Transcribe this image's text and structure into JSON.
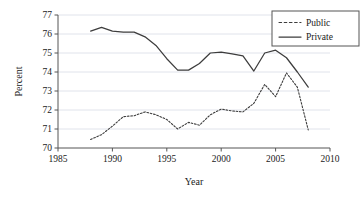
{
  "chart_data": {
    "type": "line",
    "title": "",
    "xlabel": "Year",
    "ylabel": "Percent",
    "xlim": [
      1985,
      2010
    ],
    "ylim": [
      70,
      77
    ],
    "xticks": [
      1985,
      1990,
      1995,
      2000,
      2005,
      2010
    ],
    "xticklabels": [
      "1985",
      "1990",
      "1995",
      "2000",
      "2005",
      "2010"
    ],
    "yticks": [
      70,
      71,
      72,
      73,
      74,
      75,
      76,
      77
    ],
    "yticklabels": [
      "70",
      "71",
      "72",
      "73",
      "74",
      "75",
      "76",
      "77"
    ],
    "grid": "horizontal",
    "legend_position": "top-right",
    "x": [
      1988,
      1989,
      1990,
      1991,
      1992,
      1993,
      1994,
      1995,
      1996,
      1997,
      1998,
      1999,
      2000,
      2001,
      2002,
      2003,
      2004,
      2005,
      2006,
      2007,
      2008
    ],
    "series": [
      {
        "name": "Public",
        "style": "dashed",
        "color": "#3d3d3d",
        "values": [
          70.45,
          70.7,
          71.15,
          71.65,
          71.7,
          71.9,
          71.75,
          71.5,
          71.0,
          71.35,
          71.2,
          71.75,
          72.05,
          71.95,
          71.9,
          72.35,
          73.35,
          72.7,
          73.95,
          73.2,
          70.95
        ]
      },
      {
        "name": "Private",
        "style": "solid",
        "color": "#3d3d3d",
        "values": [
          76.15,
          76.35,
          76.15,
          76.1,
          76.1,
          75.85,
          75.4,
          74.7,
          74.1,
          74.1,
          74.45,
          75.0,
          75.05,
          74.95,
          74.85,
          74.05,
          75.0,
          75.15,
          74.75,
          74.0,
          73.2
        ]
      }
    ],
    "legend": [
      {
        "label": "Public",
        "style": "dashed"
      },
      {
        "label": "Private",
        "style": "solid"
      }
    ]
  },
  "axes": {
    "x_title": "Year",
    "y_title": "Percent"
  },
  "colors": {
    "line": "#3d3d3d",
    "grid": "#d8dce6",
    "axis": "#555555",
    "text": "#1a1a1a",
    "legend_border": "#555555",
    "background": "#ffffff"
  }
}
